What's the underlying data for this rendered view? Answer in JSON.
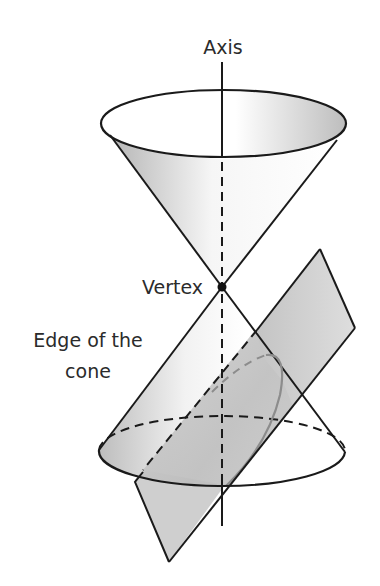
{
  "diagram": {
    "labels": {
      "axis": "Axis",
      "vertex": "Vertex",
      "edge_line1": "Edge of the",
      "edge_line2": "cone"
    },
    "colors": {
      "stroke": "#1a1a1a",
      "shade_dark": "#b8b8b8",
      "shade_light": "#f4f4f4",
      "curve": "#8c8c8c",
      "background": "#ffffff"
    },
    "elements": [
      "upper-nappe",
      "lower-nappe",
      "axis-line",
      "vertex-point",
      "cutting-plane",
      "parabola-curve"
    ]
  }
}
